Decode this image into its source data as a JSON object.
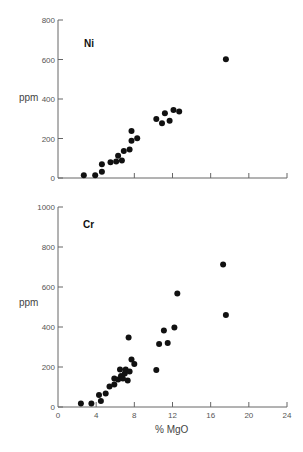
{
  "chart_data": [
    {
      "type": "scatter",
      "title": "Ni",
      "xlabel": "",
      "ylabel": "ppm",
      "xlim": [
        0,
        24
      ],
      "ylim": [
        0,
        800
      ],
      "xticks": [
        0,
        4,
        8,
        12,
        16,
        20,
        24
      ],
      "xtick_labels_shown": false,
      "yticks": [
        0,
        200,
        400,
        600,
        800
      ],
      "ytick_labels": [
        "0",
        "200",
        "400",
        "600",
        "800"
      ],
      "grid": false,
      "series": [
        {
          "name": "Ni",
          "points": [
            [
              2.7,
              14
            ],
            [
              3.9,
              14
            ],
            [
              4.6,
              32
            ],
            [
              4.6,
              70
            ],
            [
              5.5,
              80
            ],
            [
              6.1,
              83
            ],
            [
              6.3,
              113
            ],
            [
              6.7,
              88
            ],
            [
              6.9,
              137
            ],
            [
              7.5,
              145
            ],
            [
              7.7,
              189
            ],
            [
              7.7,
              238
            ],
            [
              8.3,
              201
            ],
            [
              10.3,
              299
            ],
            [
              10.9,
              277
            ],
            [
              11.2,
              328
            ],
            [
              11.7,
              290
            ],
            [
              12.1,
              344
            ],
            [
              12.7,
              336
            ],
            [
              17.6,
              601
            ]
          ]
        }
      ]
    },
    {
      "type": "scatter",
      "title": "Cr",
      "xlabel": "% MgO",
      "ylabel": "ppm",
      "xlim": [
        0,
        24
      ],
      "ylim": [
        0,
        1000
      ],
      "xticks": [
        0,
        4,
        8,
        12,
        16,
        20,
        24
      ],
      "xtick_labels": [
        "0",
        "4",
        "8",
        "12",
        "16",
        "20",
        "24"
      ],
      "yticks": [
        0,
        200,
        400,
        600,
        800,
        1000
      ],
      "ytick_labels": [
        "0",
        "200",
        "400",
        "600",
        "800",
        "1000"
      ],
      "grid": false,
      "series": [
        {
          "name": "Cr",
          "points": [
            [
              2.4,
              18
            ],
            [
              3.5,
              18
            ],
            [
              4.5,
              30
            ],
            [
              4.3,
              60
            ],
            [
              5.0,
              68
            ],
            [
              5.4,
              102
            ],
            [
              5.9,
              113
            ],
            [
              5.9,
              143
            ],
            [
              6.3,
              138
            ],
            [
              6.6,
              155
            ],
            [
              6.8,
              143
            ],
            [
              6.5,
              188
            ],
            [
              7.0,
              168
            ],
            [
              7.1,
              188
            ],
            [
              7.3,
              132
            ],
            [
              7.5,
              177
            ],
            [
              7.7,
              238
            ],
            [
              8.0,
              215
            ],
            [
              7.4,
              347
            ],
            [
              10.3,
              185
            ],
            [
              10.6,
              315
            ],
            [
              11.1,
              382
            ],
            [
              11.5,
              320
            ],
            [
              12.2,
              398
            ],
            [
              12.5,
              567
            ],
            [
              17.3,
              712
            ],
            [
              17.6,
              460
            ]
          ]
        }
      ]
    }
  ],
  "labels": {
    "ni_panel": "Ni",
    "cr_panel": "Cr",
    "ni_ylabel": "ppm",
    "cr_ylabel": "ppm",
    "xlabel": "% MgO"
  }
}
